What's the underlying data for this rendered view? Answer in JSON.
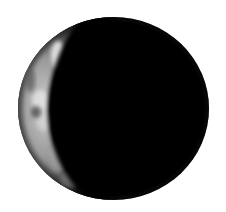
{
  "image": {
    "subject": "crescent moon",
    "phase": "crescent, lit on left side",
    "background_color": "#ffffff",
    "disc_color": "#000000",
    "lit_colors": {
      "highlight": "#e6e6e6",
      "mid": "#8a8a8a",
      "shadow": "#2a2a2a"
    }
  }
}
